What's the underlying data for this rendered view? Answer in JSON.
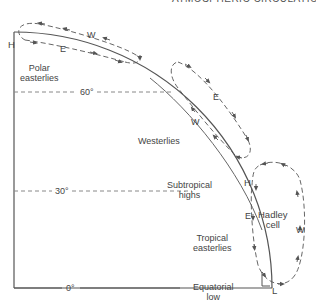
{
  "header": {
    "running_head": "ATMOSPHERIC CIRCULATION 249"
  },
  "labels": {
    "pole_pressure": "H",
    "polar_easterlies_1": "Polar",
    "polar_easterlies_2": "easterlies",
    "lat_60": "60°",
    "westerlies": "Westerlies",
    "lat_30": "30°",
    "subtropical_highs_1": "Subtropical",
    "subtropical_highs_2": "highs",
    "subtropical_pressure": "H",
    "tropical_easterlies_1": "Tropical",
    "tropical_easterlies_2": "easterlies",
    "lat_0": "0°",
    "equatorial_low_1": "Equatorial",
    "equatorial_low_2": "low",
    "equatorial_pressure": "L",
    "hadley_cell_1": "Hadley",
    "hadley_cell_2": "cell"
  },
  "cells": [
    {
      "name": "Polar cell",
      "upper_wind": "W",
      "surface_wind": "E"
    },
    {
      "name": "Ferrel cell",
      "upper_wind": "E",
      "surface_wind": "W"
    },
    {
      "name": "Hadley cell",
      "upper_wind": "W",
      "surface_wind": "E"
    }
  ],
  "colors": {
    "line": "#555555",
    "dashed": "#888888",
    "text": "#444444"
  }
}
